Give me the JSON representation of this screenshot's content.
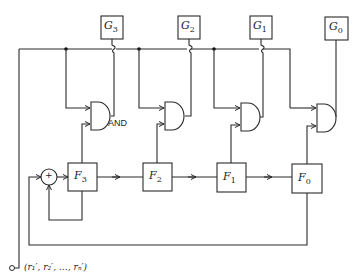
{
  "diagram": {
    "type": "circuit-block-diagram",
    "generator_boxes": [
      {
        "id": "G3",
        "base": "G",
        "sub": "3"
      },
      {
        "id": "G2",
        "base": "G",
        "sub": "2"
      },
      {
        "id": "G1",
        "base": "G",
        "sub": "1"
      },
      {
        "id": "G0",
        "base": "G",
        "sub": "0"
      }
    ],
    "register_boxes": [
      {
        "id": "F3",
        "base": "F",
        "sub": "3"
      },
      {
        "id": "F2",
        "base": "F",
        "sub": "2"
      },
      {
        "id": "F1",
        "base": "F",
        "sub": "1"
      },
      {
        "id": "F0",
        "base": "F",
        "sub": "0"
      }
    ],
    "gate_label": "AND",
    "adder_symbol": "+",
    "output_label": "(r₁′, r₂′, …, rₙ′)"
  }
}
